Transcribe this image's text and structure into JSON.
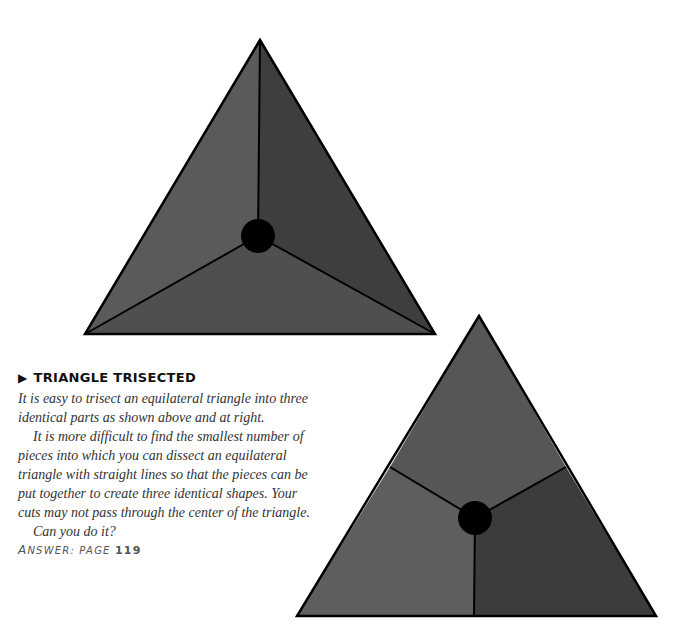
{
  "heading": {
    "marker": "▶",
    "title": "TRIANGLE TRISECTED"
  },
  "paragraphs": [
    "It is easy to trisect an equilateral triangle into three identical parts as shown above and at right.",
    "It is more difficult to find the smallest number of pieces into which you can dissect an equilateral triangle with straight lines so that the pieces can be put together to create three identical shapes. Your cuts may not pass through the center of the triangle.",
    "Can you do it?"
  ],
  "answer": {
    "first_letter": "A",
    "label_rest": "NSWER: PAGE",
    "page": "119"
  },
  "figures": {
    "top_triangle": {
      "description": "Equilateral triangle trisected by lines from center to vertices",
      "colors": {
        "left": "#5a5a5a",
        "right": "#3e3e3e",
        "bottom": "#4e4e4e",
        "center_dot": "#000000",
        "lines": "#000000"
      }
    },
    "bottom_triangle": {
      "description": "Equilateral triangle trisected by lines from center to edge midpoints",
      "colors": {
        "top": "#555555",
        "left": "#5e5e5e",
        "right": "#3c3c3c",
        "center_dot": "#000000",
        "lines": "#000000"
      }
    }
  }
}
